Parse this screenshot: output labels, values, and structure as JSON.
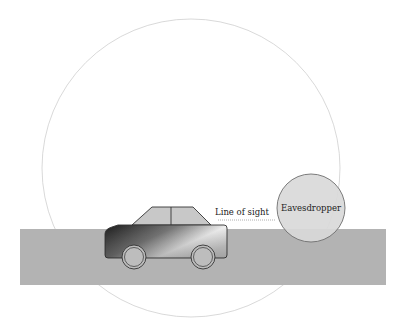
{
  "labels": {
    "line_of_sight": "Line of sight",
    "eavesdropper": "Eavesdropper"
  },
  "colors": {
    "background": "#ffffff",
    "ground": "#b3b3b3",
    "range_circle": "#cfcfcf",
    "eavesdropper_fill": "#d9d9d9",
    "eavesdropper_stroke": "#6e6e6e",
    "car_outline": "#333333",
    "cabin_fill": "#c8c8c8",
    "wheel_fill": "#bdbdbd"
  },
  "elements": {
    "range_circle": {
      "cx": 191,
      "cy": 168,
      "r": 149
    },
    "ground": {
      "x": 20,
      "y": 229,
      "width": 366,
      "height": 56
    },
    "car": {
      "body": {
        "x": 105,
        "y": 225,
        "width": 122,
        "height": 33
      },
      "wheels": [
        {
          "cx": 134,
          "cy": 257,
          "r": 12
        },
        {
          "cx": 203,
          "cy": 257,
          "r": 12
        }
      ]
    },
    "line_of_sight": {
      "x1": 218,
      "x2": 276,
      "y": 220
    },
    "eavesdropper": {
      "cx": 311,
      "cy": 208,
      "r": 34
    }
  }
}
